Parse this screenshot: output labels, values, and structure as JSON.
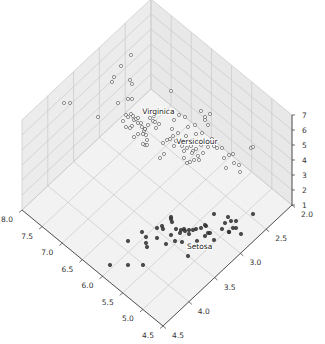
{
  "chart_data": {
    "type": "scatter3d",
    "title": "",
    "xlabel": "",
    "ylabel": "",
    "zlabel": "",
    "x_axis": {
      "name": "sepal length",
      "range": [
        4.5,
        8.0
      ],
      "ticks": [
        4.5,
        5.0,
        5.5,
        6.0,
        6.5,
        7.0,
        7.5,
        8.0
      ],
      "tick_labels": [
        "4.5",
        "5.0",
        "5.5",
        "6.0",
        "6.5",
        "7.0",
        "7.5",
        "8.0"
      ]
    },
    "y_axis": {
      "name": "sepal width",
      "range": [
        2.0,
        4.5
      ],
      "ticks": [
        2.0,
        2.5,
        3.0,
        3.5,
        4.0,
        4.5
      ],
      "tick_labels": [
        "2.0",
        "2.5",
        "3.0",
        "3.5",
        "4.0",
        "4.5"
      ]
    },
    "z_axis": {
      "name": "petal length",
      "range": [
        1,
        7
      ],
      "ticks": [
        1,
        2,
        3,
        4,
        5,
        6,
        7
      ],
      "tick_labels": [
        "1",
        "2",
        "3",
        "4",
        "5",
        "6",
        "7"
      ]
    },
    "grid": true,
    "view": {
      "elev": 48,
      "azim": -134
    },
    "annotations": [
      {
        "text": "Setosa",
        "x": 5.0,
        "y": 3.4,
        "z": 1.5
      },
      {
        "text": "Versicolour",
        "x": 5.9,
        "y": 2.75,
        "z": 4.4
      },
      {
        "text": "Virginica",
        "x": 6.6,
        "y": 2.95,
        "z": 5.5
      }
    ],
    "series": [
      {
        "name": "Setosa",
        "marker": "filled",
        "color": "#222222",
        "points_screen": [
          [
            110,
            265
          ],
          [
            128,
            265
          ],
          [
            143,
            265
          ],
          [
            128,
            241
          ],
          [
            142,
            232
          ],
          [
            157,
            238
          ],
          [
            146,
            237
          ],
          [
            146,
            243
          ],
          [
            147,
            247
          ],
          [
            162,
            226
          ],
          [
            163,
            229
          ],
          [
            172,
            222
          ],
          [
            171,
            235
          ],
          [
            176,
            229
          ],
          [
            166,
            244
          ],
          [
            175,
            241
          ],
          [
            180,
            233
          ],
          [
            181,
            230
          ],
          [
            184,
            229
          ],
          [
            185,
            231
          ],
          [
            182,
            242
          ],
          [
            189,
            234
          ],
          [
            193,
            230
          ],
          [
            196,
            229
          ],
          [
            197,
            241
          ],
          [
            201,
            228
          ],
          [
            205,
            236
          ],
          [
            208,
            233
          ],
          [
            206,
            226
          ],
          [
            214,
            240
          ],
          [
            222,
            229
          ],
          [
            228,
            217
          ],
          [
            225,
            223
          ],
          [
            231,
            221
          ],
          [
            236,
            221
          ],
          [
            233,
            228
          ],
          [
            236,
            228
          ],
          [
            229,
            232
          ],
          [
            210,
            233
          ],
          [
            200,
            248
          ],
          [
            205,
            225
          ],
          [
            189,
            230
          ],
          [
            188,
            256
          ],
          [
            253,
            214
          ],
          [
            241,
            234
          ],
          [
            229,
            232
          ],
          [
            157,
            228
          ],
          [
            214,
            214
          ],
          [
            171,
            217
          ],
          [
            171,
            219
          ]
        ]
      },
      {
        "name": "Versicolour",
        "marker": "open",
        "color": "#444444",
        "points_screen": [
          [
            163,
            143
          ],
          [
            167,
            140
          ],
          [
            173,
            136
          ],
          [
            178,
            133
          ],
          [
            176,
            141
          ],
          [
            170,
            139
          ],
          [
            174,
            146
          ],
          [
            182,
            146
          ],
          [
            184,
            151
          ],
          [
            187,
            148
          ],
          [
            191,
            146
          ],
          [
            193,
            140
          ],
          [
            199,
            142
          ],
          [
            201,
            145
          ],
          [
            196,
            149
          ],
          [
            193,
            151
          ],
          [
            184,
            158
          ],
          [
            187,
            163
          ],
          [
            190,
            162
          ],
          [
            194,
            160
          ],
          [
            198,
            156
          ],
          [
            203,
            153
          ],
          [
            208,
            147
          ],
          [
            214,
            146
          ],
          [
            217,
            148
          ],
          [
            222,
            148
          ],
          [
            224,
            158
          ],
          [
            229,
            155
          ],
          [
            234,
            163
          ],
          [
            239,
            165
          ],
          [
            226,
            168
          ],
          [
            212,
            139
          ],
          [
            172,
            129
          ],
          [
            174,
            120
          ],
          [
            179,
            115
          ],
          [
            185,
            117
          ],
          [
            188,
            127
          ],
          [
            195,
            125
          ],
          [
            205,
            117
          ],
          [
            208,
            125
          ],
          [
            202,
            133
          ],
          [
            196,
            134
          ],
          [
            186,
            136
          ],
          [
            164,
            154
          ],
          [
            160,
            158
          ],
          [
            192,
            153
          ],
          [
            199,
            160
          ],
          [
            240,
            172
          ],
          [
            233,
            154
          ],
          [
            251,
            148
          ]
        ]
      },
      {
        "name": "Virginica",
        "marker": "open",
        "color": "#444444",
        "points_screen": [
          [
            64,
            103
          ],
          [
            70,
            103
          ],
          [
            98,
            117
          ],
          [
            118,
            103
          ],
          [
            112,
            82
          ],
          [
            114,
            77
          ],
          [
            121,
            66
          ],
          [
            131,
            55
          ],
          [
            130,
            80
          ],
          [
            132,
            84
          ],
          [
            128,
            99
          ],
          [
            132,
            99
          ],
          [
            126,
            115
          ],
          [
            128,
            117
          ],
          [
            131,
            114
          ],
          [
            133,
            116
          ],
          [
            134,
            120
          ],
          [
            136,
            119
          ],
          [
            138,
            123
          ],
          [
            141,
            123
          ],
          [
            142,
            127
          ],
          [
            144,
            131
          ],
          [
            145,
            129
          ],
          [
            143,
            134
          ],
          [
            138,
            134
          ],
          [
            146,
            135
          ],
          [
            145,
            145
          ],
          [
            147,
            145
          ],
          [
            143,
            144
          ],
          [
            148,
            125
          ],
          [
            150,
            118
          ],
          [
            153,
            121
          ],
          [
            154,
            116
          ],
          [
            156,
            128
          ],
          [
            155,
            122
          ],
          [
            159,
            124
          ],
          [
            150,
            113
          ],
          [
            138,
            118
          ],
          [
            132,
            126
          ],
          [
            126,
            127
          ],
          [
            123,
            121
          ],
          [
            130,
            128
          ],
          [
            134,
            137
          ],
          [
            145,
            129
          ],
          [
            147,
            140
          ],
          [
            171,
            91
          ],
          [
            201,
            111
          ],
          [
            210,
            114
          ],
          [
            205,
            120
          ],
          [
            253,
            147
          ]
        ]
      }
    ],
    "axis_ticks_screen": {
      "x": [
        [
          155,
          318
        ],
        [
          144,
          309
        ],
        [
          127,
          294
        ],
        [
          110,
          279
        ],
        [
          93,
          265
        ],
        [
          77,
          251
        ],
        [
          60,
          237
        ],
        [
          43,
          223
        ]
      ],
      "y": [
        [
          163,
          331
        ],
        [
          187,
          308
        ],
        [
          212,
          285
        ],
        [
          237,
          262
        ],
        [
          262,
          239
        ],
        [
          287,
          216
        ]
      ],
      "z": [
        [
          298,
          203
        ],
        [
          298,
          188
        ],
        [
          298,
          173
        ],
        [
          298,
          158
        ],
        [
          298,
          143
        ],
        [
          298,
          128
        ],
        [
          298,
          113
        ]
      ]
    }
  },
  "colors": {
    "pane": "#f0f0f0",
    "pane_dark": "#e6e6e6",
    "grid": "#c8c8c8",
    "axis": "#333333",
    "marker_fill": "#3a3a3a",
    "open_marker_edge": "#555555"
  }
}
